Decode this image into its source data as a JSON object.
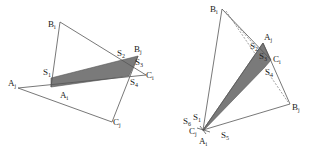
{
  "figure": {
    "left": {
      "labels": {
        "Bi": {
          "base": "B",
          "sub": "i"
        },
        "S2": {
          "base": "S",
          "sub": "2"
        },
        "Bj": {
          "base": "B",
          "sub": "j"
        },
        "S3": {
          "base": "S",
          "sub": "3"
        },
        "Ci": {
          "base": "C",
          "sub": "i"
        },
        "S4": {
          "base": "S",
          "sub": "4"
        },
        "S1": {
          "base": "S",
          "sub": "1"
        },
        "Aj": {
          "base": "A",
          "sub": "j"
        },
        "Ai": {
          "base": "A",
          "sub": "i"
        },
        "Cj": {
          "base": "C",
          "sub": "j"
        }
      }
    },
    "right": {
      "labels": {
        "Bi": {
          "base": "B",
          "sub": "i"
        },
        "Aj": {
          "base": "A",
          "sub": "j"
        },
        "S2": {
          "base": "S",
          "sub": "2"
        },
        "S3": {
          "base": "S",
          "sub": "3"
        },
        "Ci": {
          "base": "C",
          "sub": "i"
        },
        "S4": {
          "base": "S",
          "sub": "4"
        },
        "Bj": {
          "base": "B",
          "sub": "j"
        },
        "S1": {
          "base": "S",
          "sub": "1"
        },
        "S6": {
          "base": "S",
          "sub": "6"
        },
        "Cj": {
          "base": "C",
          "sub": "j"
        },
        "S5": {
          "base": "S",
          "sub": "5"
        },
        "Ai": {
          "base": "A",
          "sub": "i"
        }
      }
    },
    "colors": {
      "line": "#555555",
      "fill": "#7a7a7a",
      "dashed": "#777777"
    }
  }
}
